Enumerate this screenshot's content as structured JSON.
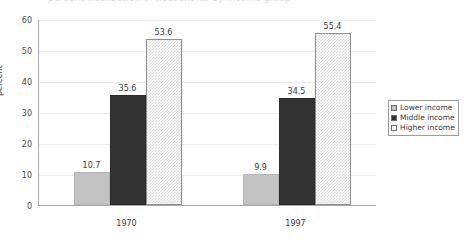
{
  "title": {
    "cut_off_text": "percent distribution of households by income group"
  },
  "chart_data": {
    "type": "bar",
    "title": "",
    "xlabel": "",
    "ylabel": "percent",
    "categories": [
      "1970",
      "1997"
    ],
    "series": [
      {
        "name": "Lower income",
        "values": [
          10.7,
          9.9
        ],
        "color": "#c3c3c3"
      },
      {
        "name": "Middle income",
        "values": [
          35.6,
          34.5
        ],
        "color": "#333333"
      },
      {
        "name": "Higher income",
        "values": [
          53.6,
          55.4
        ],
        "color": "#fbfbfb"
      }
    ],
    "ylim": [
      0,
      60
    ],
    "yticks": [
      0,
      10,
      20,
      30,
      40,
      50,
      60
    ],
    "ytick_labels": [
      "0",
      "10",
      "20",
      "30",
      "40",
      "50",
      "60"
    ],
    "grid": true,
    "legend_position": "right",
    "data_labels": [
      [
        "10.7",
        "35.6",
        "53.6"
      ],
      [
        "9.9",
        "34.5",
        "55.4"
      ]
    ]
  },
  "legend": {
    "items": [
      {
        "label": "Lower income"
      },
      {
        "label": "Middle income"
      },
      {
        "label": "Higher income"
      }
    ]
  },
  "axis": {
    "y_title": "percent"
  }
}
